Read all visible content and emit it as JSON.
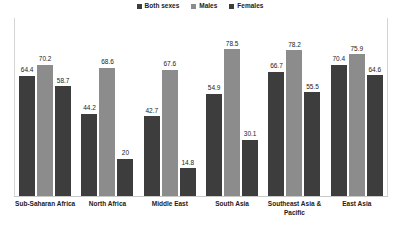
{
  "chart_data": {
    "type": "bar",
    "title": "",
    "subtitle": "",
    "xlabel": "",
    "ylabel": "",
    "ylim": [
      0,
      90
    ],
    "grid": false,
    "legend_position": "top-center",
    "categories": [
      "Sub-Saharan Africa",
      "North Africa",
      "Middle East",
      "South Asia",
      "Southeast Asia & Pacific",
      "East Asia"
    ],
    "series": [
      {
        "name": "Both sexes",
        "color": "#3d3d3d",
        "values": [
          64.4,
          44.2,
          42.7,
          54.9,
          66.7,
          70.4
        ],
        "labels": [
          "64.4",
          "44.2",
          "42.7",
          "54.9",
          "66.7",
          "70.4"
        ]
      },
      {
        "name": "Males",
        "color": "#8c8c8c",
        "values": [
          70.2,
          68.6,
          67.6,
          78.5,
          78.2,
          75.9
        ],
        "labels": [
          "70.2",
          "68.6",
          "67.6",
          "78.5",
          "78.2",
          "75.9"
        ]
      },
      {
        "name": "Females",
        "color": "#3d3d3d",
        "values": [
          58.7,
          20,
          14.8,
          30.1,
          55.5,
          64.6
        ],
        "labels": [
          "58.7",
          "20",
          "14.8",
          "30.1",
          "55.5",
          "64.6"
        ]
      }
    ]
  },
  "legend": {
    "items": [
      {
        "label": "Both sexes",
        "color": "#3d3d3d"
      },
      {
        "label": "Males",
        "color": "#8c8c8c"
      },
      {
        "label": "Females",
        "color": "#3d3d3d"
      }
    ]
  }
}
